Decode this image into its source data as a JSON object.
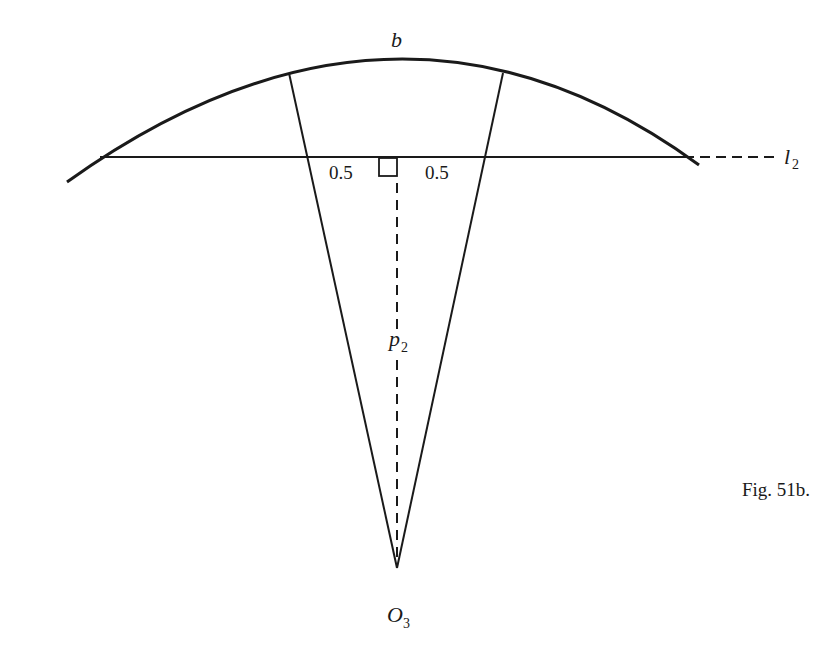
{
  "figure": {
    "caption": "Fig. 51b.",
    "labels": {
      "arc": "b",
      "line": "l",
      "line_sub": "2",
      "left_half": "0.5",
      "right_half": "0.5",
      "perpendicular": "p",
      "perpendicular_sub": "2",
      "center": "O",
      "center_sub": "3"
    },
    "colors": {
      "ink": "#1a1a1a",
      "background": "#ffffff"
    }
  }
}
